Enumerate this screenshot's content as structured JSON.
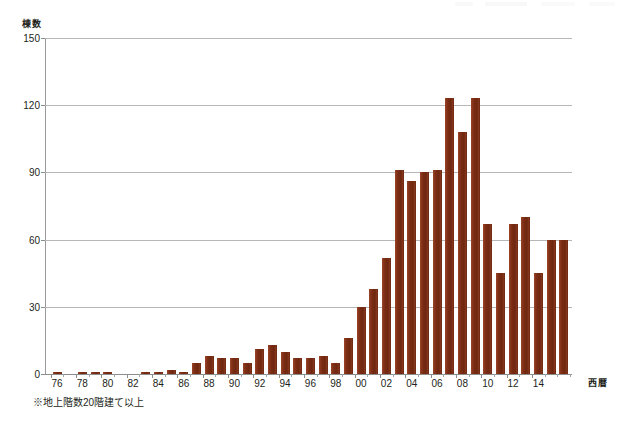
{
  "chart_data": {
    "type": "bar",
    "title": "",
    "subtitle": "",
    "xlabel": "西暦",
    "ylabel": "棟数",
    "ylim": [
      0,
      150
    ],
    "yticks": [
      0,
      30,
      60,
      90,
      120,
      150
    ],
    "ytick_labels": [
      "0",
      "30",
      "60",
      "90",
      "120",
      "150"
    ],
    "grid": true,
    "legend": false,
    "bar_color": "#7b2d15",
    "categories": [
      "1976",
      "1977",
      "1978",
      "1979",
      "1980",
      "1981",
      "1982",
      "1983",
      "1984",
      "1985",
      "1986",
      "1987",
      "1988",
      "1989",
      "1990",
      "1991",
      "1992",
      "1993",
      "1994",
      "1995",
      "1996",
      "1997",
      "1998",
      "1999",
      "2000",
      "2001",
      "2002",
      "2003",
      "2004",
      "2005",
      "2006",
      "2007",
      "2008",
      "2009",
      "2010",
      "2011",
      "2012",
      "2013",
      "2014",
      "2015",
      "2016"
    ],
    "tick_labels": [
      "76",
      "",
      "78",
      "",
      "80",
      "",
      "82",
      "",
      "84",
      "",
      "86",
      "",
      "88",
      "",
      "90",
      "",
      "92",
      "",
      "94",
      "",
      "96",
      "",
      "98",
      "",
      "00",
      "",
      "02",
      "",
      "04",
      "",
      "06",
      "",
      "08",
      "",
      "10",
      "",
      "12",
      "",
      "14",
      "",
      ""
    ],
    "values": [
      1,
      0,
      1,
      1,
      1,
      0,
      0,
      1,
      1,
      2,
      1,
      5,
      8,
      7,
      7,
      5,
      11,
      13,
      10,
      7,
      7,
      8,
      5,
      16,
      30,
      38,
      52,
      91,
      86,
      90,
      91,
      123,
      108,
      123,
      67,
      45,
      67,
      70,
      45,
      60,
      60
    ],
    "values_note": "棟数 per year",
    "footnote": "※地上階数20階建て以上"
  },
  "axis": {
    "y_title": "棟数",
    "x_title": "西暦"
  }
}
